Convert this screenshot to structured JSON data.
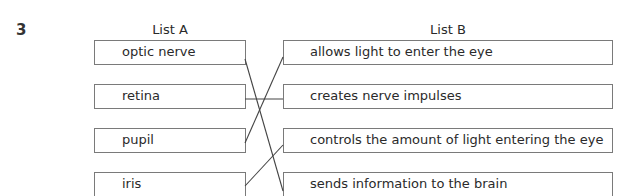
{
  "question": {
    "number": "3"
  },
  "list_a": {
    "heading": "List A",
    "items": [
      "optic nerve",
      "retina",
      "pupil",
      "iris"
    ]
  },
  "list_b": {
    "heading": "List B",
    "items": [
      "allows light to enter the eye",
      "creates nerve impulses",
      "controls the amount of light entering the eye",
      "sends information to the brain"
    ]
  },
  "matches": [
    {
      "from": "optic nerve",
      "to": "sends information to the brain"
    },
    {
      "from": "retina",
      "to": "creates nerve impulses"
    },
    {
      "from": "pupil",
      "to": "allows light to enter the eye"
    },
    {
      "from": "iris",
      "to": "controls the amount of light entering the eye"
    }
  ]
}
